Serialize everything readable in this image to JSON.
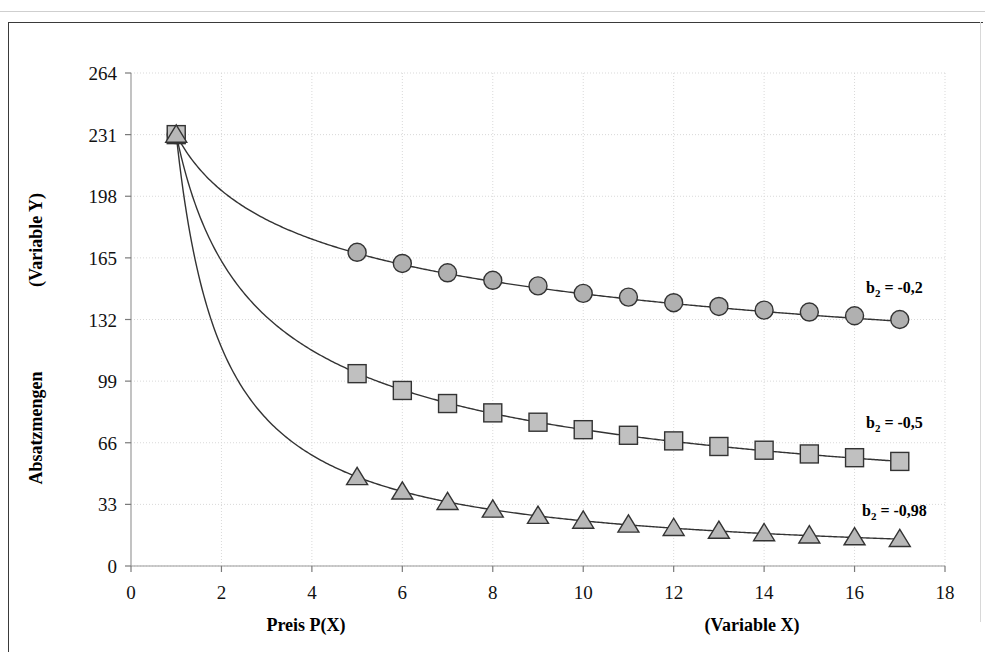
{
  "chart_data": {
    "type": "line",
    "title": "",
    "subtitle": "",
    "xlabel": "Preis P(X)",
    "xlabel_secondary": "(Variable X)",
    "ylabel": "Absatzmengen",
    "ylabel_secondary": "(Variable Y)",
    "xlim": [
      0,
      18
    ],
    "ylim": [
      0,
      264
    ],
    "xticks": [
      0,
      2,
      4,
      6,
      8,
      10,
      12,
      14,
      16,
      18
    ],
    "yticks": [
      0,
      33,
      66,
      99,
      132,
      165,
      198,
      231,
      264
    ],
    "grid": true,
    "grid_color": "#d9d9d9",
    "legend_position": "right-inline",
    "x": [
      1,
      5,
      6,
      7,
      8,
      9,
      10,
      11,
      12,
      13,
      14,
      15,
      16,
      17
    ],
    "series": [
      {
        "name": "b2 = -0,2",
        "label_main": "b",
        "label_sub": "2",
        "label_rest": " = -0,2",
        "marker": "circle",
        "b2": -0.2,
        "a": 231,
        "values": [
          231,
          168,
          162,
          157,
          153,
          150,
          146,
          144,
          141,
          139,
          137,
          136,
          134,
          132
        ],
        "marker_fill": "#b0b0b0",
        "marker_stroke": "#333333",
        "line_color": "#333333"
      },
      {
        "name": "b2 = -0,5",
        "label_main": "b",
        "label_sub": "2",
        "label_rest": " = -0,5",
        "marker": "square",
        "b2": -0.5,
        "a": 231,
        "values": [
          231,
          103,
          94,
          87,
          82,
          77,
          73,
          70,
          67,
          64,
          62,
          60,
          58,
          56
        ],
        "marker_fill": "#c0c0c0",
        "marker_stroke": "#333333",
        "line_color": "#333333"
      },
      {
        "name": "b2 = -0,98",
        "label_main": "b",
        "label_sub": "2",
        "label_rest": " = -0,98",
        "marker": "triangle",
        "b2": -0.98,
        "a": 231,
        "values": [
          231,
          47.6,
          39.9,
          34.3,
          30.2,
          26.9,
          24.3,
          22.2,
          20.4,
          18.9,
          17.6,
          16.4,
          15.4,
          14.5
        ],
        "marker_fill": "#b8b8b8",
        "marker_stroke": "#333333",
        "line_color": "#333333"
      }
    ]
  },
  "axes": {
    "x_title": "Preis P(X)",
    "x_title_secondary": "(Variable X)",
    "y_title": "Absatzmengen",
    "y_title_secondary": "(Variable Y)"
  }
}
